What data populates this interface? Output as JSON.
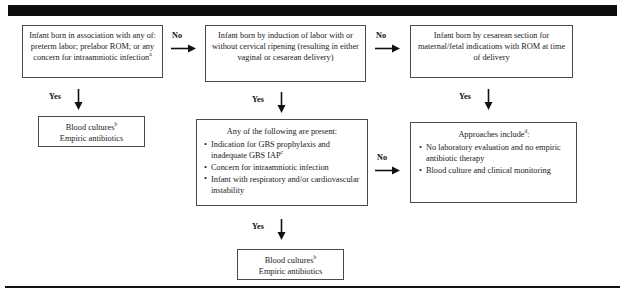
{
  "figure": {
    "type": "clinical-decision-flowchart",
    "title_bar": "",
    "footnote_markers": [
      "a",
      "b",
      "c",
      "d"
    ]
  },
  "nodes": {
    "box1": {
      "name": "maternal-risk-criteria-box",
      "text": "Infant born in association with any of: preterm labor; prelabor ROM; or any concern for intraamniotic infection",
      "superscript": "a"
    },
    "box2": {
      "name": "induction-of-labor-box",
      "text": "Infant born by induction of labor with or without cervical ripening (resulting in either vaginal or cesarean delivery)",
      "superscript": ""
    },
    "box3": {
      "name": "cesarean-section-box",
      "text": "Infant born by cesarean section for maternal/fetal indications with ROM at time of delivery",
      "superscript": ""
    },
    "box4": {
      "name": "blood-cultures-left-box",
      "line1": "Blood cultures",
      "line1_sup": "b",
      "line2": "Empiric antibiotics"
    },
    "box5": {
      "name": "clinical-findings-box",
      "heading": "Any of the following are present:",
      "bullets": [
        {
          "text": "Indication for GBS prophylaxis and inadequate GBS IAP",
          "superscript": "c"
        },
        {
          "text": "Concern for intraamniotic infection",
          "superscript": ""
        },
        {
          "text": "Infant with respiratory and/or cardiovascular instability",
          "superscript": ""
        }
      ]
    },
    "box6": {
      "name": "approaches-box",
      "heading": "Approaches include",
      "heading_sup": "d",
      "heading_tail": ":",
      "bullets": [
        {
          "text": "No laboratory evaluation and no empiric antibiotic therapy"
        },
        {
          "text": "Blood culture and clinical monitoring"
        }
      ]
    },
    "box7": {
      "name": "blood-cultures-bottom-box",
      "line1": "Blood cultures",
      "line1_sup": "b",
      "line2": "Empiric antibiotics"
    }
  },
  "connectors": {
    "no1": {
      "label": "No",
      "direction": "right"
    },
    "no2": {
      "label": "No",
      "direction": "right"
    },
    "no3": {
      "label": "No",
      "direction": "right"
    },
    "yes1": {
      "label": "Yes",
      "direction": "down"
    },
    "yes2": {
      "label": "Yes",
      "direction": "down"
    },
    "yes3": {
      "label": "Yes",
      "direction": "down"
    },
    "yes4": {
      "label": "Yes",
      "direction": "down"
    }
  },
  "colors": {
    "ink": "#1a1a1a",
    "box_border": "#4a4a4a",
    "header_bar": "#0d0d0d",
    "background": "#ffffff"
  }
}
